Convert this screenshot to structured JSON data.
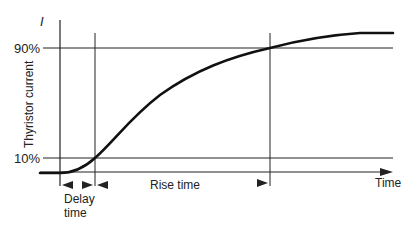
{
  "diagram": {
    "y_axis_symbol": "I",
    "y_axis_label": "Thyristor current",
    "x_axis_label": "Time",
    "levels": [
      {
        "label": "90%",
        "y": 48
      },
      {
        "label": "10%",
        "y": 158
      }
    ],
    "intervals": {
      "delay_time": {
        "line1": "Delay",
        "line2": "time"
      },
      "rise_time": {
        "label": "Rise time"
      }
    },
    "colors": {
      "line": "#222222",
      "background": "#ffffff"
    }
  }
}
